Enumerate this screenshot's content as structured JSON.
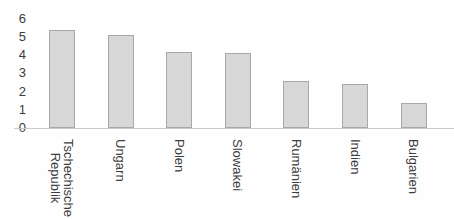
{
  "chart_data": {
    "type": "bar",
    "categories": [
      "Tschechische Republik",
      "Ungarn",
      "Polen",
      "Slowakei",
      "Rumänien",
      "Indien",
      "Bulgarien"
    ],
    "category_label_lines": [
      [
        "Tschechische",
        "Republik"
      ],
      [
        "Ungarn"
      ],
      [
        "Polen"
      ],
      [
        "Slowakei"
      ],
      [
        "Rumänien"
      ],
      [
        "Indien"
      ],
      [
        "Bulgarien"
      ]
    ],
    "values": [
      5.4,
      5.1,
      4.2,
      4.1,
      2.6,
      2.4,
      1.4
    ],
    "yticks": [
      0,
      1,
      2,
      3,
      4,
      5,
      6
    ],
    "ylim": [
      0,
      6
    ],
    "xlabel": "",
    "ylabel": "",
    "grid": false,
    "legend": "none",
    "x_label_rotation_deg": 90,
    "colors": {
      "bar_fill": "#d7d7d7",
      "bar_border": "#a8a8a8",
      "axis_line": "#c9c9c9",
      "text": "#3c3c3c",
      "background": "#fefefe"
    }
  }
}
